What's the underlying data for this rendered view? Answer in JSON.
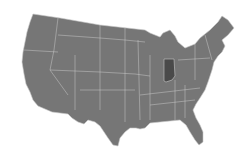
{
  "map": {
    "title": "",
    "region": "Contiguous United States",
    "highlighted_state": "Indiana",
    "colors": {
      "base": "#767676",
      "highlight": "#4a4a4a",
      "border": "#c8c8c8",
      "background": "#ffffff"
    }
  }
}
